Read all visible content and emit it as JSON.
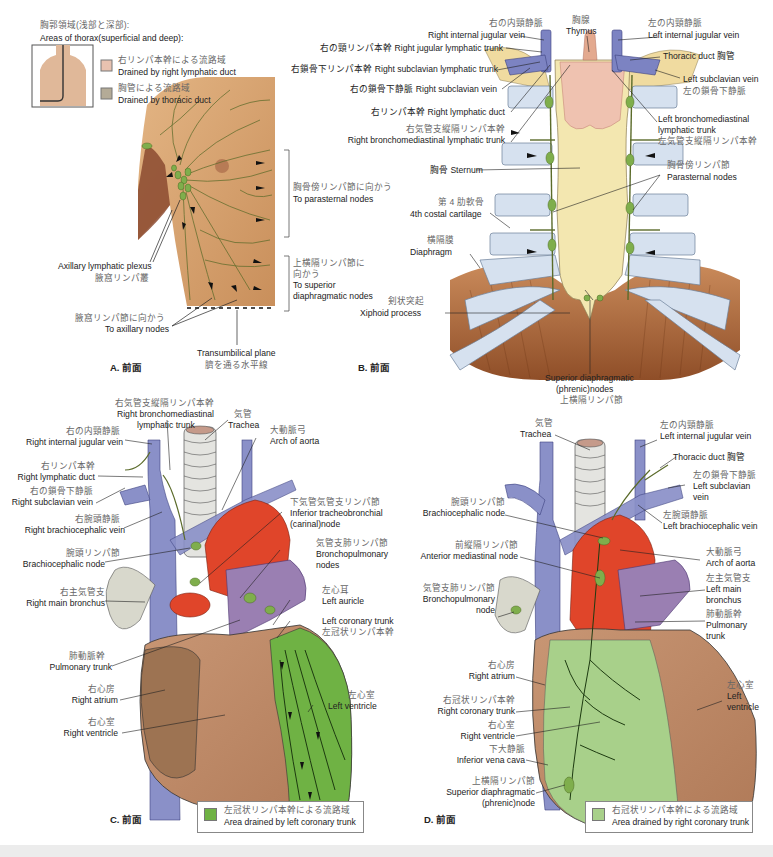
{
  "colors": {
    "skin": "#d9a872",
    "lymph_green": "#7fae4c",
    "lymph_line": "#5b6b2a",
    "vein_blue": "#8a90c8",
    "aorta_red": "#e0452a",
    "pulmonary_purple": "#9a7fb2",
    "heart_brown": "#b98462",
    "sternum_yellow": "#f3e7b0",
    "cartilage_blue": "#d6e1ef",
    "diaphragm_brown": "#a5633a",
    "thymus_pink": "#efc2b0",
    "right_duct_swatch": "#e8c2b0",
    "thoracic_duct_swatch": "#b4ab97",
    "left_coronary_swatch": "#6fb244",
    "right_coronary_swatch": "#a8d08a"
  },
  "panelA": {
    "label": "A. 前面",
    "legend": {
      "title_jp": "胸郭領域(浅部と深部):",
      "title_en": "Areas of thorax(superficial and deep):",
      "items": [
        {
          "jp": "右リンパ本幹による流路域",
          "en": "Drained by right lymphatic duct"
        },
        {
          "jp": "胸管による流路域",
          "en": "Drained by thoracic duct"
        }
      ]
    },
    "labels": {
      "axillary_plexus": {
        "en": "Axillary lymphatic plexus",
        "jp": "腋窩リンパ叢"
      },
      "parasternal": {
        "jp": "胸骨傍リンパ節に向かう",
        "en": "To parasternal nodes"
      },
      "superior_diaphragmatic": {
        "jp1": "上横隔リンパ節に",
        "jp2": "向かう",
        "en1": "To superior",
        "en2": "diaphragmatic nodes"
      },
      "axillary_nodes": {
        "jp": "腋窩リンパ節に向かう",
        "en": "To axillary nodes"
      },
      "transumbilical": {
        "en": "Transumbilical plane",
        "jp": "臍を通る水平線"
      }
    }
  },
  "panelB": {
    "label": "B. 前面",
    "labels": {
      "thymus": {
        "jp": "胸腺",
        "en": "Thymus"
      },
      "right_int_jugular": {
        "jp": "右の内頸静脈",
        "en": "Right internal jugular vein"
      },
      "left_int_jugular": {
        "jp": "左の内頸静脈",
        "en": "Left internal jugular vein"
      },
      "right_jugular_trunk": "右の頸リンパ本幹 Right jugular lymphatic trunk",
      "right_subclavian_trunk": "右鎖骨下リンパ本幹 Right subclavian lymphatic trunk",
      "right_subclavian_vein": "右の鎖骨下静脈 Right subclavian vein",
      "right_lymphatic_duct": "右リンパ本幹 Right lymphatic duct",
      "right_bronchomed": {
        "jp": "右気管支縦隔リンパ本幹",
        "en": "Right bronchomediastinal lymphatic trunk"
      },
      "thoracic_duct": "Thoracic duct 胸管",
      "left_subclavian": {
        "en": "Left subclavian vein",
        "jp": "左の鎖骨下静脈"
      },
      "left_bronchomed": {
        "en1": "Left bronchomediastinal",
        "en2": "lymphatic trunk",
        "jp": "左気管支縦隔リンパ本幹"
      },
      "sternum": "胸骨 Sternum",
      "parasternal": {
        "jp": "胸骨傍リンパ節",
        "en": "Parasternal nodes"
      },
      "costal_cartilage": {
        "jp": "第 4 肋軟骨",
        "en": "4th costal cartilage"
      },
      "diaphragm": {
        "jp": "横隔膜",
        "en": "Diaphragm"
      },
      "xiphoid": {
        "jp": "剣状突起",
        "en": "Xiphoid process"
      },
      "superior_phrenic": {
        "en1": "Superior diaphragmatic",
        "en2": "(phrenic)nodes",
        "jp": "上横隔リンパ節"
      }
    }
  },
  "panelC": {
    "label": "C. 前面",
    "legend": {
      "jp": "左冠状リンパ本幹による流路域",
      "en": "Area drained by left coronary trunk"
    },
    "labels": {
      "right_bronchomed": {
        "jp": "右気管支縦隔リンパ本幹",
        "en1": "Right bronchomediastinal",
        "en2": "lymphatic trunk"
      },
      "trachea": {
        "jp": "気管",
        "en": "Trachea"
      },
      "right_int_jugular": {
        "jp": "右の内頸静脈",
        "en": "Right internal jugular vein"
      },
      "arch_aorta": {
        "jp": "大動脈弓",
        "en": "Arch of aorta"
      },
      "right_lymphatic_duct": {
        "jp": "右リンパ本幹",
        "en": "Right lymphatic duct"
      },
      "right_subclavian": {
        "jp": "右の鎖骨下静脈",
        "en": "Right subclavian vein"
      },
      "right_brachiocephalic": {
        "jp": "右腕頭静脈",
        "en": "Right brachiocephalic vein"
      },
      "inferior_tracheo": {
        "jp": "下気管気管支リンパ節",
        "en1": "Inferior tracheobronchial",
        "en2": "(carinal)node"
      },
      "brachiocephalic_node": {
        "jp": "腕頭リンパ節",
        "en": "Brachiocephalic node"
      },
      "bronchopulmonary": {
        "jp": "気管支肺リンパ節",
        "en1": "Bronchopulmonary",
        "en2": "nodes"
      },
      "right_main_bronchus": {
        "jp": "右主気管支",
        "en": "Right main bronchus"
      },
      "left_auricle": {
        "jp": "左心耳",
        "en": "Left auricle"
      },
      "left_coronary": {
        "en": "Left coronary trunk",
        "jp": "左冠状リンパ本幹"
      },
      "pulmonary_trunk": {
        "jp": "肺動脈幹",
        "en": "Pulmonary trunk"
      },
      "right_atrium": {
        "jp": "右心房",
        "en": "Right atrium"
      },
      "left_ventricle": {
        "jp": "左心室",
        "en": "Left ventricle"
      },
      "right_ventricle": {
        "jp": "右心室",
        "en": "Right ventricle"
      }
    }
  },
  "panelD": {
    "label": "D. 前面",
    "legend": {
      "jp": "右冠状リンパ本幹による流路域",
      "en": "Area drained by right coronary trunk"
    },
    "labels": {
      "trachea": {
        "jp": "気管",
        "en": "Trachea"
      },
      "left_int_jugular": {
        "jp": "左の内頸静脈",
        "en": "Left internal jugular vein"
      },
      "thoracic_duct": "Thoracic duct 胸管",
      "left_subclavian": {
        "jp": "左の鎖骨下静脈",
        "en1": "Left subclavian",
        "en2": "vein"
      },
      "brachiocephalic_node": {
        "jp": "腕頭リンパ節",
        "en": "Brachiocephalic node"
      },
      "left_brachiocephalic": {
        "jp": "左腕頭静脈",
        "en": "Left brachiocephalic vein"
      },
      "anterior_med": {
        "jp": "前縦隔リンパ節",
        "en": "Anterior mediastinal node"
      },
      "arch_aorta": {
        "jp": "大動脈弓",
        "en": "Arch of aorta"
      },
      "left_main_bronchus": {
        "jp": "左主気管支",
        "en1": "Left main",
        "en2": "bronchus"
      },
      "bronchopulmonary": {
        "jp": "気管支肺リンパ節",
        "en1": "Bronchopulmonary",
        "en2": "node"
      },
      "pulmonary_trunk": {
        "jp": "肺動脈幹",
        "en1": "Pulmonary",
        "en2": "trunk"
      },
      "right_atrium": {
        "jp": "右心房",
        "en": "Right atrium"
      },
      "left_ventricle": {
        "jp": "左心室",
        "en1": "Left",
        "en2": "ventricle"
      },
      "right_coronary": {
        "jp": "右冠状リンパ本幹",
        "en": "Right coronary trunk"
      },
      "right_ventricle": {
        "jp": "右心室",
        "en": "Right ventricle"
      },
      "ivc": {
        "jp": "下大静脈",
        "en": "Inferior vena cava"
      },
      "superior_phrenic": {
        "jp": "上横隔リンパ節",
        "en1": "Superior diaphragmatic",
        "en2": "(phrenic)node"
      }
    }
  }
}
